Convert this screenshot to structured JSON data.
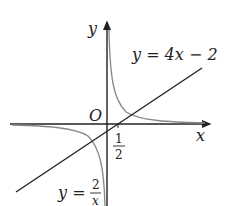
{
  "figure": {
    "axes": {
      "x_label": "x",
      "y_label": "y",
      "origin_label": "O"
    },
    "tick": {
      "numerator": "1",
      "denominator": "2"
    },
    "line": {
      "label": "y = 4x − 2",
      "color": "#222222"
    },
    "hyperbola": {
      "label_prefix": "y = ",
      "numerator": "2",
      "denominator": "x",
      "color": "#888888"
    }
  }
}
